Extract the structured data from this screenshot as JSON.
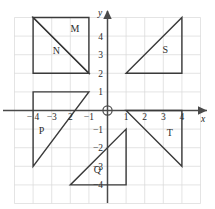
{
  "figure": {
    "type": "coordinate-plane-geometry",
    "axis_labels": {
      "x": "x",
      "y": "y"
    },
    "origin_marker": "circle",
    "grid": {
      "visible": true,
      "spacing": 1,
      "color": "#d8d8d8"
    },
    "axis_color": "#4a4a4a",
    "shape_color": "#3a3a3a",
    "x_range": [
      -5,
      5
    ],
    "y_range": [
      -5,
      5
    ],
    "x_ticks": [
      {
        "value": -4,
        "label": "− 4"
      },
      {
        "value": -3,
        "label": "−3"
      },
      {
        "value": -2,
        "label": "2"
      },
      {
        "value": -1,
        "label": "−1"
      },
      {
        "value": 1,
        "label": "1"
      },
      {
        "value": 2,
        "label": "2"
      },
      {
        "value": 3,
        "label": "3"
      },
      {
        "value": 4,
        "label": "4"
      }
    ],
    "y_ticks": [
      {
        "value": 4,
        "label": "4"
      },
      {
        "value": 3,
        "label": "3"
      },
      {
        "value": 2,
        "label": "2"
      },
      {
        "value": 1,
        "label": "1"
      },
      {
        "value": -1,
        "label": "−1"
      },
      {
        "value": -2,
        "label": "−2"
      },
      {
        "value": -3,
        "label": "−3"
      },
      {
        "value": -4,
        "label": "−4"
      }
    ],
    "shapes": [
      {
        "id": "M",
        "label": "M",
        "kind": "triangle",
        "points": [
          [
            -4,
            5
          ],
          [
            -1,
            5
          ],
          [
            -1,
            2
          ]
        ],
        "label_at": [
          -1.75,
          4.2
        ]
      },
      {
        "id": "N",
        "label": "N",
        "kind": "triangle",
        "points": [
          [
            -4,
            5
          ],
          [
            -1,
            2
          ],
          [
            -4,
            2
          ]
        ],
        "label_at": [
          -2.75,
          3.05
        ]
      },
      {
        "id": "S",
        "label": "S",
        "kind": "triangle",
        "points": [
          [
            1,
            2
          ],
          [
            4,
            5
          ],
          [
            4,
            2
          ]
        ],
        "label_at": [
          3.1,
          3.1
        ]
      },
      {
        "id": "P",
        "label": "P",
        "kind": "triangle",
        "points": [
          [
            -4,
            1
          ],
          [
            -1,
            1
          ],
          [
            -4,
            -3
          ]
        ],
        "label_at": [
          -3.55,
          -1.25
        ]
      },
      {
        "id": "Q",
        "label": "Q",
        "kind": "triangle",
        "points": [
          [
            -2,
            -4
          ],
          [
            1,
            -4
          ],
          [
            1,
            -1
          ]
        ],
        "label_at": [
          -0.55,
          -3.35
        ]
      },
      {
        "id": "T",
        "label": "T",
        "kind": "triangle",
        "points": [
          [
            1,
            0
          ],
          [
            4,
            0
          ],
          [
            4,
            -3
          ]
        ],
        "label_at": [
          3.35,
          -1.35
        ]
      }
    ]
  }
}
